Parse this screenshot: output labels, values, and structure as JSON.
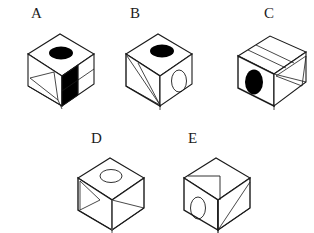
{
  "figure": {
    "title": "",
    "background_color": "#ffffff",
    "line_color": "#1b1b1b",
    "fill_black": "#000000",
    "fill_white": "#ffffff",
    "type": "multiple-choice-cube-diagram",
    "option_count": 5
  },
  "options": [
    {
      "id": "A",
      "label": "A",
      "row": 1,
      "column": 1,
      "top_face": {
        "marking": "filled-ellipse",
        "color": "#000000"
      },
      "left_face": {
        "marking": "triangle-outline",
        "color": "#ffffff"
      },
      "right_face": {
        "marking": "quadrant-grid",
        "filled_cell": "top-left",
        "color": "#000000"
      }
    },
    {
      "id": "B",
      "label": "B",
      "row": 1,
      "column": 2,
      "top_face": {
        "marking": "filled-ellipse",
        "color": "#000000"
      },
      "left_face": {
        "marking": "triangle-fan-outline",
        "color": "#ffffff"
      },
      "right_face": {
        "marking": "open-ellipse",
        "color": "#ffffff"
      }
    },
    {
      "id": "C",
      "label": "C",
      "row": 1,
      "column": 3,
      "top_face": {
        "marking": "band-and-triangle-outline",
        "color": "#ffffff"
      },
      "left_face": {
        "marking": "filled-ellipse",
        "color": "#000000"
      },
      "right_face": {
        "marking": "triangle-outline",
        "color": "#ffffff"
      }
    },
    {
      "id": "D",
      "label": "D",
      "row": 2,
      "column": 1,
      "top_face": {
        "marking": "open-ellipse",
        "color": "#ffffff"
      },
      "left_face": {
        "marking": "triangle-outline",
        "color": "#ffffff"
      },
      "right_face": {
        "marking": "triangle-outline",
        "color": "#ffffff"
      }
    },
    {
      "id": "E",
      "label": "E",
      "row": 2,
      "column": 2,
      "top_face": {
        "marking": "square-outline",
        "color": "#ffffff"
      },
      "left_face": {
        "marking": "open-ellipse",
        "color": "#ffffff"
      },
      "right_face": {
        "marking": "diagonal-lines",
        "color": "#ffffff"
      }
    }
  ]
}
